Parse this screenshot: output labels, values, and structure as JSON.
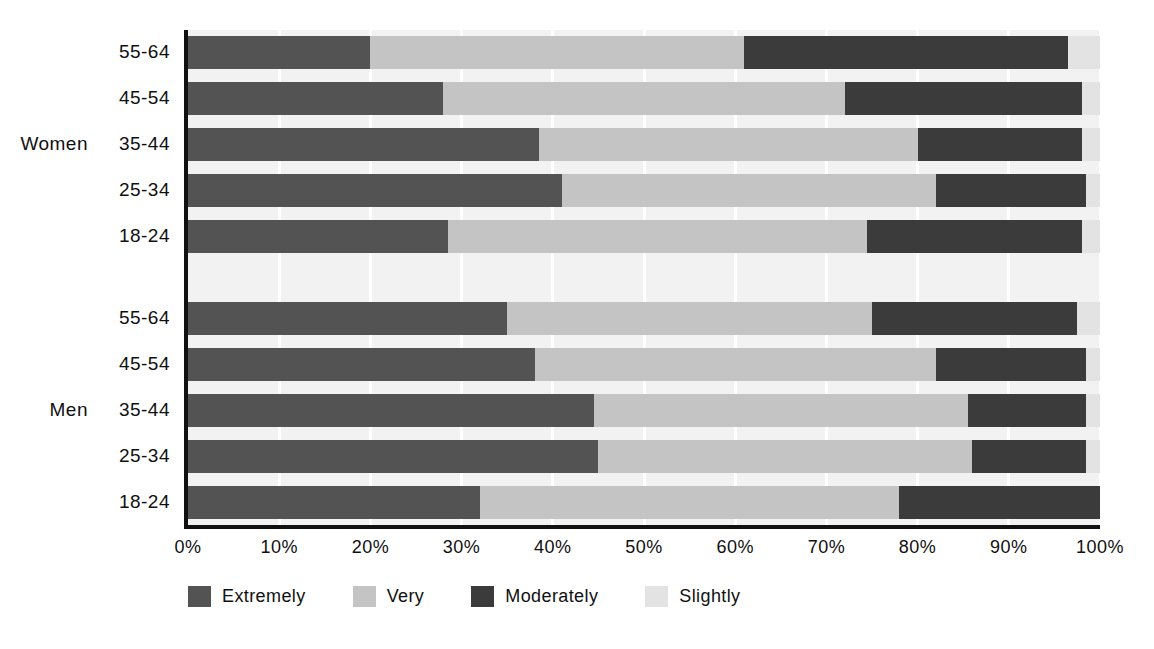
{
  "chart_data": {
    "type": "bar",
    "orientation": "horizontal",
    "stacked": true,
    "normalized": true,
    "title": "",
    "subtitle": "",
    "xlabel": "",
    "ylabel": "",
    "xlim": [
      0,
      100
    ],
    "xtick_labels": [
      "0%",
      "10%",
      "20%",
      "30%",
      "40%",
      "50%",
      "60%",
      "70%",
      "80%",
      "90%",
      "100%"
    ],
    "xticks": [
      0,
      10,
      20,
      30,
      40,
      50,
      60,
      70,
      80,
      90,
      100
    ],
    "grid": true,
    "grid_axis": "x",
    "legend_position": "bottom-left",
    "series": [
      {
        "name": "Extremely",
        "color": "#535353"
      },
      {
        "name": "Very",
        "color": "#c4c4c4"
      },
      {
        "name": "Moderately",
        "color": "#3b3b3b"
      },
      {
        "name": "Slightly",
        "color": "#e3e3e3"
      }
    ],
    "group_labels": [
      "Women",
      "Men"
    ],
    "groups": [
      {
        "name": "Women",
        "categories": [
          "55-64",
          "45-54",
          "35-44",
          "25-34",
          "18-24"
        ],
        "rows": [
          {
            "category": "55-64",
            "values": [
              20.0,
              41.0,
              35.5,
              3.5
            ]
          },
          {
            "category": "45-54",
            "values": [
              28.0,
              44.0,
              26.0,
              2.0
            ]
          },
          {
            "category": "35-44",
            "values": [
              38.5,
              41.5,
              18.0,
              2.0
            ]
          },
          {
            "category": "25-34",
            "values": [
              41.0,
              41.0,
              16.5,
              1.5
            ]
          },
          {
            "category": "18-24",
            "values": [
              28.5,
              46.0,
              23.5,
              2.0
            ]
          }
        ]
      },
      {
        "name": "Men",
        "categories": [
          "55-64",
          "45-54",
          "35-44",
          "25-34",
          "18-24"
        ],
        "rows": [
          {
            "category": "55-64",
            "values": [
              35.0,
              40.0,
              22.5,
              2.5
            ]
          },
          {
            "category": "45-54",
            "values": [
              38.0,
              44.0,
              16.5,
              1.5
            ]
          },
          {
            "category": "35-44",
            "values": [
              44.5,
              41.0,
              13.0,
              1.5
            ]
          },
          {
            "category": "25-34",
            "values": [
              45.0,
              41.0,
              12.5,
              1.5
            ]
          },
          {
            "category": "18-24",
            "values": [
              32.0,
              46.0,
              22.0,
              0.0
            ]
          }
        ]
      }
    ]
  },
  "axis": {
    "ticks": [
      {
        "label": "0%",
        "value": 0
      },
      {
        "label": "10%",
        "value": 10
      },
      {
        "label": "20%",
        "value": 20
      },
      {
        "label": "30%",
        "value": 30
      },
      {
        "label": "40%",
        "value": 40
      },
      {
        "label": "50%",
        "value": 50
      },
      {
        "label": "60%",
        "value": 60
      },
      {
        "label": "70%",
        "value": 70
      },
      {
        "label": "80%",
        "value": 80
      },
      {
        "label": "90%",
        "value": 90
      },
      {
        "label": "100%",
        "value": 100
      }
    ]
  },
  "legend": {
    "items": [
      {
        "label": "Extremely",
        "color": "#535353"
      },
      {
        "label": "Very",
        "color": "#c4c4c4"
      },
      {
        "label": "Moderately",
        "color": "#3b3b3b"
      },
      {
        "label": "Slightly",
        "color": "#e3e3e3"
      }
    ]
  },
  "colors": {
    "extremely": "#535353",
    "very": "#c4c4c4",
    "moderately": "#3b3b3b",
    "slightly": "#e3e3e3",
    "axis": "#111111",
    "gridline": "#ffffff",
    "plot_band": "#f2f2f2",
    "background": "#ffffff",
    "text": "#101010"
  }
}
